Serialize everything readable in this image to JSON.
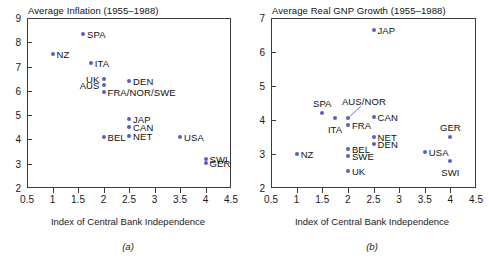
{
  "figure": {
    "accent_color": "#5a5fc0",
    "axis_color": "#3a3a3a"
  },
  "chart_data": [
    {
      "type": "scatter",
      "panel": "a",
      "title": "Average Inflation (1955–1988)",
      "caption": "(a)",
      "xlabel": "Index of Central Bank Independence",
      "ylabel": "",
      "xlim": [
        0.5,
        4.5
      ],
      "ylim": [
        2,
        9
      ],
      "xticks": [
        0.5,
        1,
        1.5,
        2,
        2.5,
        3,
        3.5,
        4,
        4.5
      ],
      "xticklabels": [
        "0.5",
        "1",
        "1.5",
        "2",
        "2.5",
        "3",
        "3.5",
        "4",
        "4.5"
      ],
      "yticks": [
        2,
        3,
        4,
        5,
        6,
        7,
        8,
        9
      ],
      "yticklabels": [
        "2",
        "3",
        "4",
        "5",
        "6",
        "7",
        "8",
        "9"
      ],
      "grid": false,
      "legend": "none",
      "points": [
        {
          "label": "SPA",
          "x": 1.6,
          "y": 8.35,
          "align": "right"
        },
        {
          "label": "NZ",
          "x": 1.0,
          "y": 7.5,
          "align": "right"
        },
        {
          "label": "ITA",
          "x": 1.75,
          "y": 7.15,
          "align": "right"
        },
        {
          "label": "UK",
          "x": 2.0,
          "y": 6.5,
          "align": "left"
        },
        {
          "label": "AUS",
          "x": 2.0,
          "y": 6.25,
          "align": "left"
        },
        {
          "label": "DEN",
          "x": 2.5,
          "y": 6.4,
          "align": "right"
        },
        {
          "label": "FRA/NOR/SWE",
          "x": 2.0,
          "y": 5.95,
          "align": "right"
        },
        {
          "label": "JAP",
          "x": 2.5,
          "y": 4.85,
          "align": "right"
        },
        {
          "label": "CAN",
          "x": 2.5,
          "y": 4.5,
          "align": "right"
        },
        {
          "label": "NET",
          "x": 2.5,
          "y": 4.15,
          "align": "right"
        },
        {
          "label": "BEL",
          "x": 2.0,
          "y": 4.1,
          "align": "right"
        },
        {
          "label": "USA",
          "x": 3.5,
          "y": 4.1,
          "align": "right"
        },
        {
          "label": "SWI",
          "x": 4.0,
          "y": 3.2,
          "align": "right"
        },
        {
          "label": "GER",
          "x": 4.0,
          "y": 3.05,
          "align": "right"
        }
      ]
    },
    {
      "type": "scatter",
      "panel": "b",
      "title": "Average Real GNP Growth (1955–1988)",
      "caption": "(b)",
      "xlabel": "Index of Central Bank Independence",
      "ylabel": "",
      "xlim": [
        0.5,
        4.5
      ],
      "ylim": [
        2,
        7
      ],
      "xticks": [
        0.5,
        1,
        1.5,
        2,
        2.5,
        3,
        3.5,
        4,
        4.5
      ],
      "xticklabels": [
        "0.5",
        "1",
        "1.5",
        "2",
        "2.5",
        "3",
        "3.5",
        "4",
        "4.5"
      ],
      "yticks": [
        2,
        3,
        4,
        5,
        6,
        7
      ],
      "yticklabels": [
        "2",
        "3",
        "4",
        "5",
        "6",
        "7"
      ],
      "grid": false,
      "legend": "none",
      "points": [
        {
          "label": "JAP",
          "x": 2.5,
          "y": 6.65,
          "align": "right"
        },
        {
          "label": "SPA",
          "x": 1.5,
          "y": 4.2,
          "align": "above"
        },
        {
          "label": "ITA",
          "x": 1.75,
          "y": 4.05,
          "align": "below"
        },
        {
          "label": "AUS/NOR",
          "x": 2.0,
          "y": 4.05,
          "align": "leader"
        },
        {
          "label": "CAN",
          "x": 2.5,
          "y": 4.1,
          "align": "right"
        },
        {
          "label": "FRA",
          "x": 2.0,
          "y": 3.85,
          "align": "right"
        },
        {
          "label": "NET",
          "x": 2.5,
          "y": 3.5,
          "align": "right"
        },
        {
          "label": "GER",
          "x": 4.0,
          "y": 3.5,
          "align": "above"
        },
        {
          "label": "DEN",
          "x": 2.5,
          "y": 3.3,
          "align": "right"
        },
        {
          "label": "BEL",
          "x": 2.0,
          "y": 3.15,
          "align": "right"
        },
        {
          "label": "NZ",
          "x": 1.0,
          "y": 3.0,
          "align": "right"
        },
        {
          "label": "USA",
          "x": 3.5,
          "y": 3.05,
          "align": "right"
        },
        {
          "label": "SWE",
          "x": 2.0,
          "y": 2.95,
          "align": "right"
        },
        {
          "label": "SWI",
          "x": 4.0,
          "y": 2.8,
          "align": "below"
        },
        {
          "label": "UK",
          "x": 2.0,
          "y": 2.5,
          "align": "right"
        }
      ]
    }
  ]
}
